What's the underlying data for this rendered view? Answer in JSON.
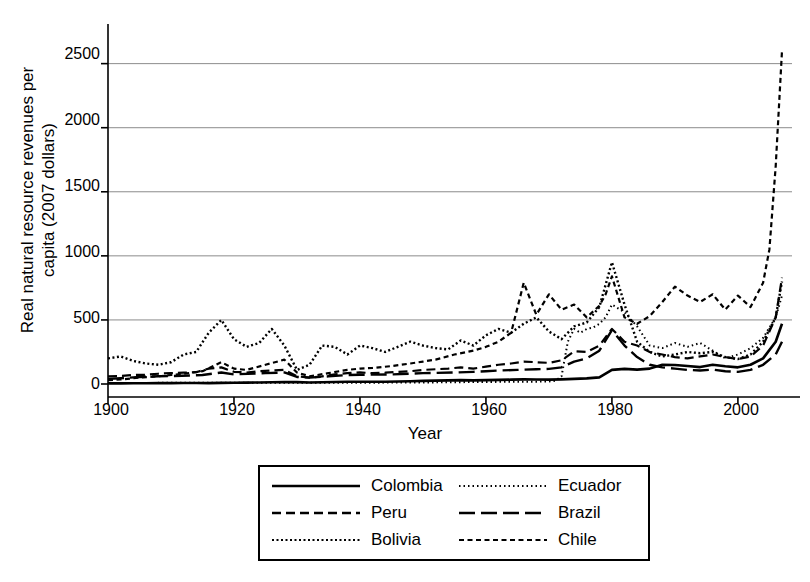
{
  "chart_data": {
    "type": "line",
    "title": "",
    "xlabel": "Year",
    "ylabel": "Real natural resource revenues per\ncapita (2007 dollars)",
    "xlim": [
      1900,
      2007
    ],
    "ylim": [
      0,
      2700
    ],
    "xticks": [
      1900,
      1920,
      1940,
      1960,
      1980,
      2000
    ],
    "yticks": [
      0,
      500,
      1000,
      1500,
      2000,
      2500
    ],
    "grid": "horizontal",
    "legend_position": "below-plot",
    "colors": {
      "line": "#000000",
      "grid": "#8c8c8c",
      "axis": "#000000",
      "background": "#ffffff"
    },
    "series": [
      {
        "name": "Colombia",
        "dash": "solid",
        "width": 2.6,
        "x": [
          1900,
          1902,
          1904,
          1906,
          1908,
          1910,
          1912,
          1914,
          1916,
          1918,
          1920,
          1922,
          1924,
          1926,
          1928,
          1930,
          1932,
          1934,
          1936,
          1938,
          1940,
          1942,
          1944,
          1946,
          1948,
          1950,
          1952,
          1954,
          1956,
          1958,
          1960,
          1962,
          1964,
          1966,
          1968,
          1970,
          1972,
          1974,
          1976,
          1978,
          1980,
          1982,
          1984,
          1986,
          1988,
          1990,
          1992,
          1994,
          1996,
          1998,
          2000,
          2002,
          2004,
          2006,
          2007
        ],
        "values": [
          5,
          5,
          6,
          6,
          7,
          7,
          8,
          8,
          7,
          9,
          10,
          11,
          12,
          14,
          16,
          15,
          12,
          14,
          16,
          18,
          18,
          17,
          18,
          20,
          22,
          24,
          26,
          28,
          30,
          28,
          30,
          32,
          34,
          36,
          35,
          34,
          36,
          40,
          44,
          52,
          110,
          118,
          112,
          120,
          150,
          148,
          140,
          132,
          150,
          138,
          130,
          150,
          200,
          330,
          470
        ]
      },
      {
        "name": "Peru",
        "dash": "dashed",
        "width": 2.2,
        "x": [
          1900,
          1902,
          1904,
          1906,
          1908,
          1910,
          1912,
          1914,
          1916,
          1918,
          1920,
          1922,
          1924,
          1926,
          1928,
          1930,
          1932,
          1934,
          1936,
          1938,
          1940,
          1942,
          1944,
          1946,
          1948,
          1950,
          1952,
          1954,
          1956,
          1958,
          1960,
          1962,
          1964,
          1966,
          1968,
          1970,
          1972,
          1974,
          1976,
          1978,
          1980,
          1982,
          1984,
          1986,
          1988,
          1990,
          1992,
          1994,
          1996,
          1998,
          2000,
          2002,
          2004,
          2006,
          2007
        ],
        "values": [
          60,
          62,
          70,
          72,
          80,
          85,
          88,
          92,
          120,
          130,
          95,
          90,
          100,
          105,
          110,
          60,
          50,
          60,
          75,
          85,
          90,
          85,
          88,
          95,
          100,
          110,
          115,
          120,
          130,
          120,
          135,
          150,
          160,
          175,
          170,
          165,
          185,
          255,
          250,
          300,
          430,
          330,
          300,
          250,
          230,
          210,
          200,
          215,
          230,
          210,
          195,
          215,
          300,
          520,
          830
        ]
      },
      {
        "name": "Bolivia",
        "dash": "dotted",
        "width": 2.4,
        "x": [
          1900,
          1902,
          1904,
          1906,
          1908,
          1910,
          1912,
          1914,
          1916,
          1918,
          1920,
          1922,
          1924,
          1926,
          1928,
          1930,
          1932,
          1934,
          1936,
          1938,
          1940,
          1942,
          1944,
          1946,
          1948,
          1950,
          1952,
          1954,
          1956,
          1958,
          1960,
          1962,
          1964,
          1966,
          1968,
          1970,
          1972,
          1974,
          1976,
          1978,
          1980,
          1982,
          1984,
          1986,
          1988,
          1990,
          1992,
          1994,
          1996,
          1998,
          2000,
          2002,
          2004,
          2006,
          2007
        ],
        "values": [
          200,
          215,
          180,
          160,
          150,
          170,
          230,
          250,
          400,
          500,
          350,
          290,
          320,
          430,
          300,
          110,
          150,
          300,
          290,
          230,
          300,
          280,
          250,
          290,
          330,
          300,
          280,
          270,
          340,
          300,
          380,
          430,
          400,
          470,
          520,
          410,
          350,
          450,
          480,
          600,
          950,
          620,
          330,
          250,
          215,
          230,
          250,
          240,
          250,
          210,
          195,
          230,
          330,
          520,
          800
        ]
      },
      {
        "name": "Ecuador",
        "dash": "fine-dotted",
        "width": 2.0,
        "x": [
          1900,
          1910,
          1920,
          1930,
          1940,
          1950,
          1955,
          1960,
          1965,
          1968,
          1970,
          1971,
          1972,
          1973,
          1974,
          1975,
          1976,
          1977,
          1978,
          1979,
          1980,
          1982,
          1984,
          1986,
          1988,
          1990,
          1992,
          1994,
          1996,
          1998,
          2000,
          2002,
          2004,
          2006,
          2007
        ],
        "values": [
          8,
          9,
          10,
          9,
          10,
          12,
          14,
          16,
          18,
          18,
          20,
          25,
          60,
          330,
          430,
          400,
          430,
          440,
          470,
          520,
          620,
          560,
          450,
          300,
          280,
          320,
          290,
          320,
          260,
          200,
          230,
          280,
          360,
          520,
          690
        ]
      },
      {
        "name": "Brazil",
        "dash": "long-dash",
        "width": 2.4,
        "x": [
          1900,
          1902,
          1905,
          1908,
          1910,
          1915,
          1918,
          1920,
          1925,
          1928,
          1930,
          1932,
          1935,
          1938,
          1940,
          1945,
          1948,
          1950,
          1955,
          1958,
          1960,
          1962,
          1965,
          1968,
          1970,
          1972,
          1974,
          1976,
          1978,
          1980,
          1982,
          1984,
          1986,
          1988,
          1990,
          1992,
          1994,
          1996,
          1998,
          2000,
          2002,
          2004,
          2006,
          2007
        ],
        "values": [
          40,
          45,
          55,
          60,
          62,
          70,
          90,
          75,
          85,
          90,
          55,
          50,
          60,
          70,
          72,
          75,
          80,
          85,
          90,
          95,
          100,
          105,
          110,
          115,
          118,
          130,
          175,
          200,
          260,
          420,
          300,
          210,
          150,
          130,
          120,
          110,
          105,
          112,
          100,
          95,
          110,
          150,
          230,
          330
        ]
      },
      {
        "name": "Chile",
        "dash": "medium-dash",
        "width": 2.2,
        "x": [
          1900,
          1902,
          1905,
          1908,
          1910,
          1912,
          1915,
          1918,
          1920,
          1922,
          1925,
          1928,
          1930,
          1932,
          1935,
          1938,
          1940,
          1942,
          1945,
          1948,
          1950,
          1952,
          1955,
          1958,
          1960,
          1962,
          1964,
          1966,
          1968,
          1970,
          1972,
          1974,
          1976,
          1978,
          1979,
          1980,
          1982,
          1984,
          1986,
          1988,
          1990,
          1992,
          1994,
          1996,
          1998,
          2000,
          2002,
          2004,
          2005,
          2006,
          2007
        ],
        "values": [
          30,
          35,
          50,
          60,
          70,
          80,
          100,
          170,
          120,
          110,
          150,
          190,
          90,
          60,
          85,
          110,
          120,
          125,
          140,
          160,
          175,
          190,
          230,
          260,
          290,
          330,
          400,
          790,
          540,
          700,
          580,
          620,
          520,
          610,
          700,
          840,
          520,
          470,
          530,
          640,
          760,
          690,
          640,
          700,
          580,
          690,
          600,
          790,
          1050,
          1700,
          2600
        ]
      }
    ]
  },
  "axes": {
    "ylabel_text": "Real natural resource revenues per\ncapita (2007 dollars)",
    "xlabel_text": "Year",
    "ytick_labels": [
      "0",
      "500",
      "1000",
      "1500",
      "2000",
      "2500"
    ],
    "xtick_labels": [
      "1900",
      "1920",
      "1940",
      "1960",
      "1980",
      "2000"
    ]
  },
  "legend": {
    "items": [
      {
        "label": "Colombia",
        "style": "solid"
      },
      {
        "label": "Ecuador",
        "style": "fine-dotted"
      },
      {
        "label": "Peru",
        "style": "dashed"
      },
      {
        "label": "Brazil",
        "style": "long-dash"
      },
      {
        "label": "Bolivia",
        "style": "dotted"
      },
      {
        "label": "Chile",
        "style": "medium-dash"
      }
    ]
  }
}
